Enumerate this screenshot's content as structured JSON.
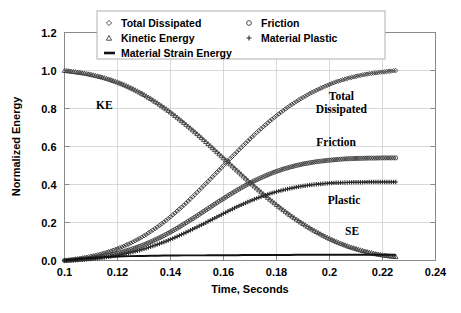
{
  "chart_data": {
    "type": "line",
    "title": "",
    "xlabel": "Time, Seconds",
    "ylabel": "Normalized Energy",
    "xlim": [
      0.1,
      0.24
    ],
    "ylim": [
      0.0,
      1.2
    ],
    "xticks": [
      "0.1",
      "0.12",
      "0.14",
      "0.16",
      "0.18",
      "0.2",
      "0.22",
      "0.24"
    ],
    "xtick_values": [
      0.1,
      0.12,
      0.14,
      0.16,
      0.18,
      0.2,
      0.22,
      0.24
    ],
    "yticks": [
      "0.0",
      "0.2",
      "0.4",
      "0.6",
      "0.8",
      "1.0",
      "1.2"
    ],
    "ytick_values": [
      0.0,
      0.2,
      0.4,
      0.6,
      0.8,
      1.0,
      1.2
    ],
    "grid": true,
    "legend_position": "top-center",
    "legend": [
      {
        "label": "Total Dissipated",
        "marker": "diamond-open"
      },
      {
        "label": "Friction",
        "marker": "circle-open"
      },
      {
        "label": "Kinetic Energy",
        "marker": "triangle-open"
      },
      {
        "label": "Material Plastic",
        "marker": "plus"
      },
      {
        "label": "Material Strain Energy",
        "marker": "line"
      }
    ],
    "annotations": [
      {
        "text": "KE",
        "x": 0.115,
        "y": 0.8
      },
      {
        "text": "Total",
        "x": 0.2045,
        "y": 0.845
      },
      {
        "text": "Dissipated",
        "x": 0.2045,
        "y": 0.775
      },
      {
        "text": "Friction",
        "x": 0.2025,
        "y": 0.605
      },
      {
        "text": "Plastic",
        "x": 0.2055,
        "y": 0.295
      },
      {
        "text": "SE",
        "x": 0.2085,
        "y": 0.135
      }
    ],
    "x": [
      0.1,
      0.1025,
      0.105,
      0.1075,
      0.11,
      0.1125,
      0.115,
      0.1175,
      0.12,
      0.1225,
      0.125,
      0.1275,
      0.13,
      0.1325,
      0.135,
      0.1375,
      0.14,
      0.1425,
      0.145,
      0.1475,
      0.15,
      0.1525,
      0.155,
      0.1575,
      0.16,
      0.1625,
      0.165,
      0.1675,
      0.17,
      0.1725,
      0.175,
      0.1775,
      0.18,
      0.1825,
      0.185,
      0.1875,
      0.19,
      0.1925,
      0.195,
      0.1975,
      0.2,
      0.2025,
      0.205,
      0.2075,
      0.21,
      0.2125,
      0.215,
      0.2175,
      0.22,
      0.2225,
      0.225
    ],
    "series": [
      {
        "name": "Kinetic Energy",
        "marker": "triangle-open",
        "values": [
          1.0,
          0.996,
          0.991,
          0.986,
          0.979,
          0.971,
          0.962,
          0.951,
          0.939,
          0.925,
          0.909,
          0.892,
          0.873,
          0.852,
          0.83,
          0.806,
          0.781,
          0.754,
          0.726,
          0.697,
          0.667,
          0.636,
          0.604,
          0.572,
          0.54,
          0.508,
          0.476,
          0.444,
          0.412,
          0.381,
          0.351,
          0.322,
          0.294,
          0.267,
          0.241,
          0.217,
          0.194,
          0.172,
          0.152,
          0.133,
          0.116,
          0.1,
          0.086,
          0.073,
          0.062,
          0.052,
          0.043,
          0.035,
          0.029,
          0.024,
          0.02
        ]
      },
      {
        "name": "Total Dissipated",
        "marker": "diamond-open",
        "values": [
          0.0,
          0.004,
          0.009,
          0.015,
          0.022,
          0.03,
          0.039,
          0.05,
          0.062,
          0.076,
          0.092,
          0.11,
          0.13,
          0.152,
          0.176,
          0.202,
          0.23,
          0.26,
          0.291,
          0.324,
          0.358,
          0.393,
          0.428,
          0.464,
          0.5,
          0.536,
          0.571,
          0.606,
          0.64,
          0.673,
          0.704,
          0.734,
          0.762,
          0.789,
          0.814,
          0.837,
          0.858,
          0.878,
          0.896,
          0.912,
          0.927,
          0.94,
          0.951,
          0.961,
          0.969,
          0.977,
          0.983,
          0.988,
          0.992,
          0.996,
          1.0
        ]
      },
      {
        "name": "Friction",
        "marker": "circle-open",
        "values": [
          0.0,
          0.002,
          0.005,
          0.008,
          0.012,
          0.017,
          0.023,
          0.03,
          0.038,
          0.047,
          0.058,
          0.07,
          0.083,
          0.098,
          0.114,
          0.131,
          0.15,
          0.17,
          0.191,
          0.213,
          0.235,
          0.258,
          0.281,
          0.304,
          0.326,
          0.348,
          0.369,
          0.389,
          0.408,
          0.425,
          0.441,
          0.456,
          0.469,
          0.481,
          0.491,
          0.5,
          0.508,
          0.514,
          0.52,
          0.524,
          0.528,
          0.531,
          0.534,
          0.536,
          0.537,
          0.538,
          0.539,
          0.539,
          0.54,
          0.54,
          0.54
        ]
      },
      {
        "name": "Material Plastic",
        "marker": "plus",
        "values": [
          0.0,
          0.001,
          0.003,
          0.005,
          0.008,
          0.012,
          0.016,
          0.021,
          0.027,
          0.034,
          0.042,
          0.051,
          0.061,
          0.072,
          0.084,
          0.097,
          0.111,
          0.126,
          0.142,
          0.159,
          0.176,
          0.193,
          0.211,
          0.229,
          0.247,
          0.265,
          0.282,
          0.298,
          0.313,
          0.327,
          0.34,
          0.352,
          0.362,
          0.371,
          0.379,
          0.386,
          0.392,
          0.397,
          0.401,
          0.404,
          0.407,
          0.409,
          0.41,
          0.411,
          0.412,
          0.412,
          0.413,
          0.413,
          0.413,
          0.413,
          0.413
        ]
      },
      {
        "name": "Material Strain Energy",
        "marker": "line",
        "values": [
          0.0,
          0.004,
          0.008,
          0.011,
          0.014,
          0.016,
          0.018,
          0.02,
          0.021,
          0.022,
          0.023,
          0.024,
          0.024,
          0.025,
          0.025,
          0.026,
          0.026,
          0.026,
          0.027,
          0.027,
          0.027,
          0.027,
          0.028,
          0.028,
          0.028,
          0.028,
          0.028,
          0.029,
          0.029,
          0.029,
          0.029,
          0.029,
          0.029,
          0.029,
          0.029,
          0.03,
          0.03,
          0.03,
          0.03,
          0.03,
          0.03,
          0.03,
          0.03,
          0.03,
          0.03,
          0.03,
          0.03,
          0.03,
          0.03,
          0.03,
          0.03
        ]
      }
    ]
  }
}
